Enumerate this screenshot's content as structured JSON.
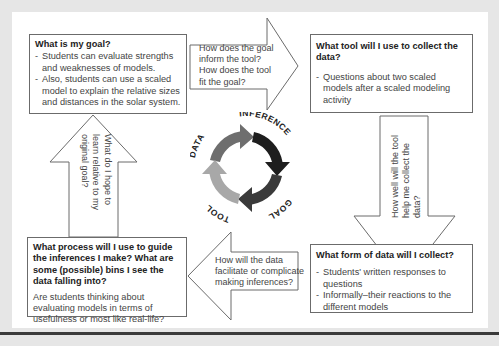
{
  "boxes": {
    "goal": {
      "title": "What is my goal?",
      "items": [
        "Students can evaluate strengths and weaknesses of models.",
        "Also, students can use a scaled model to explain the relative sizes and distances in the solar system."
      ]
    },
    "tool": {
      "title": "What tool will I use to collect the data?",
      "items": [
        "Questions about two scaled models after a scaled modeling activity"
      ]
    },
    "data": {
      "title": "What form of data will I collect?",
      "items": [
        "Students' written responses to questions",
        "Informally–their reactions to the different models"
      ]
    },
    "inference": {
      "title": "What process will I use to guide the inferences I make? What are some (possible) bins I see the data falling into?",
      "body": "Are students thinking about evaluating models in terms of usefulness or most like real-life?"
    }
  },
  "arrows": {
    "right": "How does the goal inform the tool? How does the tool fit the goal?",
    "down": "How well will the tool help me collect the data?",
    "left": "How will the data facilitate or complicate making inferences?",
    "up": "What do I hope to learn relative to my original goal?"
  },
  "cycle": {
    "labels": [
      "GOAL",
      "TOOL",
      "DATA",
      "INFERENCE"
    ],
    "colors": {
      "goal": "#6e6e6e",
      "tool": "#1e1e1e",
      "data": "#3a3a3a",
      "inference": "#a8a8a8"
    }
  }
}
